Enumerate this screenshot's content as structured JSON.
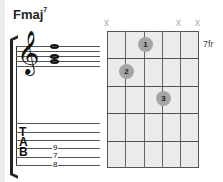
{
  "chord": {
    "name": "Fmaj",
    "extension": "7"
  },
  "staff": {
    "clef": "treble-clef",
    "notes": [
      "C",
      "A",
      "F"
    ]
  },
  "tab": {
    "letters": [
      "T",
      "A",
      "B"
    ],
    "frets": [
      "9",
      "7",
      "8"
    ]
  },
  "fretboard": {
    "start_fret_label": "7fr",
    "muted_strings": [
      "x",
      "x",
      "x"
    ],
    "fingers": [
      {
        "label": "1",
        "string": 3,
        "fret": 1
      },
      {
        "label": "2",
        "string": 2,
        "fret": 2
      },
      {
        "label": "3",
        "string": 4,
        "fret": 3
      }
    ]
  }
}
